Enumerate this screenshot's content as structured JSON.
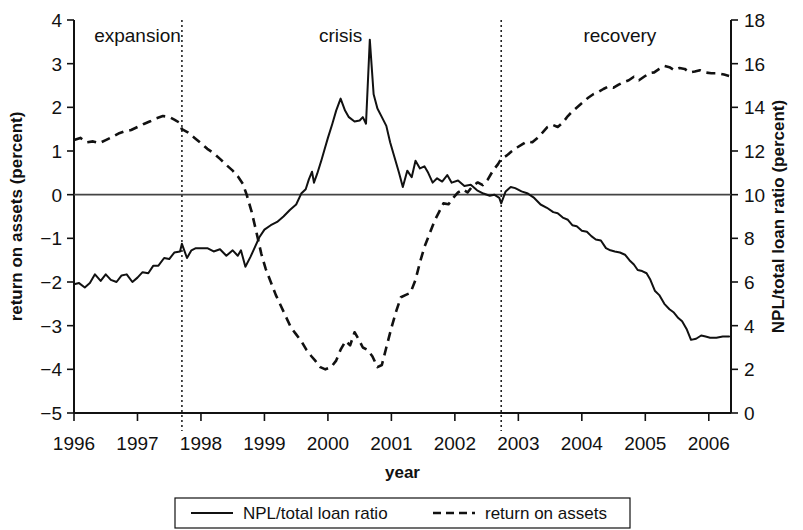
{
  "chart_data": {
    "type": "line",
    "title": "",
    "xlabel": "year",
    "ylabel_left": "return on assets (percent)",
    "ylabel_right": "NPL/total loan ratio (percent)",
    "xlim": [
      1996.0,
      2006.35
    ],
    "ylim_left": [
      -5,
      4
    ],
    "ylim_right": [
      0,
      18
    ],
    "left_ticks": [
      "4",
      "3",
      "2",
      "1",
      "0",
      "−1",
      "−2",
      "−3",
      "−4",
      "−5"
    ],
    "left_tick_values": [
      4,
      3,
      2,
      1,
      0,
      -1,
      -2,
      -3,
      -4,
      -5
    ],
    "right_ticks": [
      "18",
      "16",
      "14",
      "12",
      "10",
      "8",
      "6",
      "4",
      "2",
      "0"
    ],
    "right_tick_values": [
      18,
      16,
      14,
      12,
      10,
      8,
      6,
      4,
      2,
      0
    ],
    "x_ticks": [
      "1996",
      "1997",
      "1998",
      "1999",
      "2000",
      "2001",
      "2002",
      "2003",
      "2004",
      "2005",
      "2006"
    ],
    "x_tick_values": [
      1996,
      1997,
      1998,
      1999,
      2000,
      2001,
      2002,
      2003,
      2004,
      2005,
      2006
    ],
    "grid": false,
    "legend_position": "bottom",
    "annotations": [
      {
        "label": "expansion",
        "x": 1997.0
      },
      {
        "label": "crisis",
        "x": 2000.2
      },
      {
        "label": "recovery",
        "x": 2004.6
      }
    ],
    "dividers": [
      1997.7,
      2002.73
    ],
    "series": [
      {
        "name": "NPL/total loan ratio",
        "axis": "right",
        "style": "solid",
        "color": "#111111",
        "points": [
          [
            1996.0,
            5.9
          ],
          [
            1996.08,
            5.95
          ],
          [
            1996.17,
            5.75
          ],
          [
            1996.25,
            5.95
          ],
          [
            1996.33,
            6.35
          ],
          [
            1996.42,
            6.05
          ],
          [
            1996.5,
            6.35
          ],
          [
            1996.58,
            6.1
          ],
          [
            1996.67,
            6.0
          ],
          [
            1996.75,
            6.3
          ],
          [
            1996.83,
            6.35
          ],
          [
            1996.92,
            6.0
          ],
          [
            1997.0,
            6.2
          ],
          [
            1997.08,
            6.45
          ],
          [
            1997.17,
            6.4
          ],
          [
            1997.25,
            6.75
          ],
          [
            1997.33,
            6.75
          ],
          [
            1997.42,
            7.1
          ],
          [
            1997.5,
            7.05
          ],
          [
            1997.58,
            7.35
          ],
          [
            1997.67,
            7.4
          ],
          [
            1997.7,
            7.75
          ],
          [
            1997.78,
            7.1
          ],
          [
            1997.85,
            7.45
          ],
          [
            1997.92,
            7.55
          ],
          [
            1998.0,
            7.55
          ],
          [
            1998.1,
            7.55
          ],
          [
            1998.2,
            7.4
          ],
          [
            1998.3,
            7.5
          ],
          [
            1998.4,
            7.2
          ],
          [
            1998.5,
            7.45
          ],
          [
            1998.58,
            7.2
          ],
          [
            1998.63,
            7.45
          ],
          [
            1998.7,
            6.7
          ],
          [
            1998.78,
            7.15
          ],
          [
            1998.85,
            7.6
          ],
          [
            1998.92,
            8.05
          ],
          [
            1999.0,
            8.4
          ],
          [
            1999.1,
            8.6
          ],
          [
            1999.2,
            8.75
          ],
          [
            1999.3,
            9.0
          ],
          [
            1999.4,
            9.3
          ],
          [
            1999.5,
            9.55
          ],
          [
            1999.58,
            10.05
          ],
          [
            1999.65,
            10.25
          ],
          [
            1999.7,
            10.7
          ],
          [
            1999.75,
            11.05
          ],
          [
            1999.78,
            10.55
          ],
          [
            1999.83,
            10.95
          ],
          [
            1999.9,
            11.6
          ],
          [
            1999.95,
            12.1
          ],
          [
            2000.0,
            12.6
          ],
          [
            2000.07,
            13.25
          ],
          [
            2000.13,
            13.85
          ],
          [
            2000.2,
            14.4
          ],
          [
            2000.27,
            13.85
          ],
          [
            2000.33,
            13.55
          ],
          [
            2000.42,
            13.35
          ],
          [
            2000.5,
            13.4
          ],
          [
            2000.55,
            13.55
          ],
          [
            2000.6,
            13.25
          ],
          [
            2000.66,
            17.1
          ],
          [
            2000.72,
            14.6
          ],
          [
            2000.78,
            13.95
          ],
          [
            2000.85,
            13.55
          ],
          [
            2000.92,
            13.15
          ],
          [
            2000.98,
            12.4
          ],
          [
            2001.05,
            11.7
          ],
          [
            2001.12,
            11.0
          ],
          [
            2001.18,
            10.35
          ],
          [
            2001.25,
            11.1
          ],
          [
            2001.32,
            10.8
          ],
          [
            2001.38,
            11.55
          ],
          [
            2001.45,
            11.2
          ],
          [
            2001.52,
            11.3
          ],
          [
            2001.58,
            11.0
          ],
          [
            2001.65,
            10.55
          ],
          [
            2001.72,
            10.75
          ],
          [
            2001.8,
            10.6
          ],
          [
            2001.88,
            10.9
          ],
          [
            2001.95,
            10.55
          ],
          [
            2002.05,
            10.65
          ],
          [
            2002.15,
            10.4
          ],
          [
            2002.25,
            10.45
          ],
          [
            2002.35,
            10.2
          ],
          [
            2002.45,
            10.05
          ],
          [
            2002.55,
            9.95
          ],
          [
            2002.62,
            10.0
          ],
          [
            2002.7,
            9.85
          ],
          [
            2002.73,
            9.6
          ],
          [
            2002.8,
            10.15
          ],
          [
            2002.88,
            10.35
          ],
          [
            2002.95,
            10.3
          ],
          [
            2003.05,
            10.15
          ],
          [
            2003.15,
            10.05
          ],
          [
            2003.25,
            9.85
          ],
          [
            2003.35,
            9.55
          ],
          [
            2003.45,
            9.4
          ],
          [
            2003.55,
            9.2
          ],
          [
            2003.62,
            9.15
          ],
          [
            2003.7,
            8.95
          ],
          [
            2003.78,
            8.85
          ],
          [
            2003.85,
            8.6
          ],
          [
            2003.92,
            8.55
          ],
          [
            2004.0,
            8.35
          ],
          [
            2004.08,
            8.3
          ],
          [
            2004.15,
            8.1
          ],
          [
            2004.22,
            7.95
          ],
          [
            2004.3,
            7.9
          ],
          [
            2004.38,
            7.55
          ],
          [
            2004.45,
            7.45
          ],
          [
            2004.52,
            7.4
          ],
          [
            2004.6,
            7.35
          ],
          [
            2004.68,
            7.25
          ],
          [
            2004.75,
            7.0
          ],
          [
            2004.82,
            6.8
          ],
          [
            2004.88,
            6.55
          ],
          [
            2004.95,
            6.5
          ],
          [
            2005.02,
            6.4
          ],
          [
            2005.08,
            6.1
          ],
          [
            2005.15,
            5.6
          ],
          [
            2005.22,
            5.4
          ],
          [
            2005.3,
            5.0
          ],
          [
            2005.38,
            4.75
          ],
          [
            2005.45,
            4.6
          ],
          [
            2005.52,
            4.35
          ],
          [
            2005.58,
            4.2
          ],
          [
            2005.65,
            3.85
          ],
          [
            2005.72,
            3.35
          ],
          [
            2005.8,
            3.4
          ],
          [
            2005.88,
            3.55
          ],
          [
            2005.95,
            3.5
          ],
          [
            2006.02,
            3.45
          ],
          [
            2006.12,
            3.45
          ],
          [
            2006.22,
            3.5
          ],
          [
            2006.32,
            3.5
          ]
        ]
      },
      {
        "name": "return on assets",
        "axis": "left",
        "style": "dashed",
        "color": "#111111",
        "points": [
          [
            1996.0,
            1.25
          ],
          [
            1996.1,
            1.3
          ],
          [
            1996.2,
            1.2
          ],
          [
            1996.3,
            1.22
          ],
          [
            1996.4,
            1.18
          ],
          [
            1996.5,
            1.25
          ],
          [
            1996.6,
            1.32
          ],
          [
            1996.7,
            1.4
          ],
          [
            1996.8,
            1.45
          ],
          [
            1996.9,
            1.48
          ],
          [
            1997.0,
            1.55
          ],
          [
            1997.1,
            1.62
          ],
          [
            1997.2,
            1.68
          ],
          [
            1997.3,
            1.75
          ],
          [
            1997.4,
            1.8
          ],
          [
            1997.5,
            1.78
          ],
          [
            1997.58,
            1.72
          ],
          [
            1997.66,
            1.65
          ],
          [
            1997.7,
            1.5
          ],
          [
            1997.8,
            1.42
          ],
          [
            1997.9,
            1.3
          ],
          [
            1998.0,
            1.18
          ],
          [
            1998.1,
            1.05
          ],
          [
            1998.2,
            0.95
          ],
          [
            1998.3,
            0.82
          ],
          [
            1998.4,
            0.68
          ],
          [
            1998.5,
            0.55
          ],
          [
            1998.58,
            0.42
          ],
          [
            1998.66,
            0.25
          ],
          [
            1998.72,
            0.0
          ],
          [
            1998.8,
            -0.4
          ],
          [
            1998.88,
            -0.9
          ],
          [
            1998.95,
            -1.35
          ],
          [
            1999.02,
            -1.7
          ],
          [
            1999.1,
            -2.0
          ],
          [
            1999.18,
            -2.3
          ],
          [
            1999.26,
            -2.55
          ],
          [
            1999.34,
            -2.8
          ],
          [
            1999.42,
            -3.05
          ],
          [
            1999.5,
            -3.2
          ],
          [
            1999.58,
            -3.35
          ],
          [
            1999.66,
            -3.55
          ],
          [
            1999.74,
            -3.7
          ],
          [
            1999.8,
            -3.8
          ],
          [
            1999.88,
            -3.95
          ],
          [
            1999.96,
            -4.0
          ],
          [
            2000.05,
            -3.95
          ],
          [
            2000.13,
            -3.8
          ],
          [
            2000.2,
            -3.55
          ],
          [
            2000.28,
            -3.35
          ],
          [
            2000.35,
            -3.45
          ],
          [
            2000.42,
            -3.15
          ],
          [
            2000.48,
            -3.3
          ],
          [
            2000.55,
            -3.5
          ],
          [
            2000.62,
            -3.55
          ],
          [
            2000.7,
            -3.7
          ],
          [
            2000.78,
            -3.95
          ],
          [
            2000.85,
            -3.9
          ],
          [
            2000.92,
            -3.5
          ],
          [
            2001.0,
            -3.05
          ],
          [
            2001.08,
            -2.65
          ],
          [
            2001.15,
            -2.35
          ],
          [
            2001.22,
            -2.3
          ],
          [
            2001.3,
            -2.25
          ],
          [
            2001.38,
            -1.95
          ],
          [
            2001.45,
            -1.55
          ],
          [
            2001.52,
            -1.2
          ],
          [
            2001.6,
            -0.9
          ],
          [
            2001.68,
            -0.6
          ],
          [
            2001.75,
            -0.4
          ],
          [
            2001.82,
            -0.2
          ],
          [
            2001.9,
            -0.22
          ],
          [
            2001.97,
            -0.08
          ],
          [
            2002.05,
            0.05
          ],
          [
            2002.13,
            0.12
          ],
          [
            2002.2,
            0.05
          ],
          [
            2002.28,
            0.2
          ],
          [
            2002.36,
            0.28
          ],
          [
            2002.44,
            0.22
          ],
          [
            2002.52,
            0.35
          ],
          [
            2002.6,
            0.55
          ],
          [
            2002.68,
            0.7
          ],
          [
            2002.73,
            0.82
          ],
          [
            2002.82,
            0.9
          ],
          [
            2002.9,
            1.0
          ],
          [
            2002.98,
            1.08
          ],
          [
            2003.06,
            1.15
          ],
          [
            2003.14,
            1.22
          ],
          [
            2003.22,
            1.2
          ],
          [
            2003.3,
            1.3
          ],
          [
            2003.38,
            1.42
          ],
          [
            2003.46,
            1.55
          ],
          [
            2003.54,
            1.6
          ],
          [
            2003.62,
            1.55
          ],
          [
            2003.7,
            1.65
          ],
          [
            2003.78,
            1.8
          ],
          [
            2003.86,
            1.92
          ],
          [
            2003.94,
            2.02
          ],
          [
            2004.02,
            2.12
          ],
          [
            2004.1,
            2.22
          ],
          [
            2004.18,
            2.3
          ],
          [
            2004.26,
            2.35
          ],
          [
            2004.34,
            2.42
          ],
          [
            2004.42,
            2.48
          ],
          [
            2004.5,
            2.45
          ],
          [
            2004.58,
            2.52
          ],
          [
            2004.66,
            2.58
          ],
          [
            2004.74,
            2.62
          ],
          [
            2004.82,
            2.7
          ],
          [
            2004.9,
            2.62
          ],
          [
            2004.98,
            2.7
          ],
          [
            2005.06,
            2.78
          ],
          [
            2005.14,
            2.8
          ],
          [
            2005.22,
            2.88
          ],
          [
            2005.3,
            2.95
          ],
          [
            2005.38,
            2.92
          ],
          [
            2005.46,
            2.85
          ],
          [
            2005.54,
            2.9
          ],
          [
            2005.62,
            2.88
          ],
          [
            2005.7,
            2.8
          ],
          [
            2005.78,
            2.82
          ],
          [
            2005.86,
            2.85
          ],
          [
            2005.94,
            2.8
          ],
          [
            2006.04,
            2.78
          ],
          [
            2006.14,
            2.78
          ],
          [
            2006.24,
            2.75
          ],
          [
            2006.32,
            2.72
          ]
        ]
      }
    ],
    "legend": [
      {
        "label": "NPL/total loan ratio",
        "style": "solid"
      },
      {
        "label": "return on assets",
        "style": "dashed"
      }
    ]
  }
}
